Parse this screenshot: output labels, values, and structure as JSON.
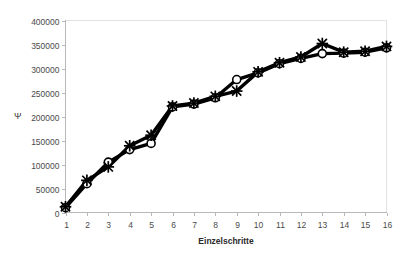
{
  "chart_data": {
    "type": "line",
    "title": "",
    "subtitle": "",
    "xlabel": "Einzelschritte",
    "ylabel": "Ψ",
    "x": [
      1,
      2,
      3,
      4,
      5,
      6,
      7,
      8,
      9,
      10,
      11,
      12,
      13,
      14,
      15,
      16
    ],
    "categories": [
      "1",
      "2",
      "3",
      "4",
      "5",
      "6",
      "7",
      "8",
      "9",
      "10",
      "11",
      "12",
      "13",
      "14",
      "15",
      "16"
    ],
    "xlim": [
      1,
      16
    ],
    "ylim": [
      0,
      400000
    ],
    "ytick_values": [
      0,
      50000,
      100000,
      150000,
      200000,
      250000,
      300000,
      350000,
      400000
    ],
    "ytick_labels": [
      "0",
      "50000",
      "100000",
      "150000",
      "200000",
      "250000",
      "300000",
      "350000",
      "400000"
    ],
    "xtick_labels": [
      "1",
      "2",
      "3",
      "4",
      "5",
      "6",
      "7",
      "8",
      "9",
      "10",
      "11",
      "12",
      "13",
      "14",
      "15",
      "16"
    ],
    "grid": false,
    "legend": false,
    "legend_position": "none",
    "series": [
      {
        "name": "Serie 1",
        "marker": "circle",
        "color": "#000000",
        "values": [
          10000,
          60000,
          105000,
          131000,
          144000,
          220000,
          226000,
          239000,
          277000,
          291000,
          310000,
          321000,
          331000,
          332000,
          334000,
          343000
        ]
      },
      {
        "name": "Serie 2",
        "marker": "x",
        "color": "#000000",
        "values": [
          12000,
          67000,
          95000,
          139000,
          161000,
          222000,
          228000,
          242000,
          253000,
          293000,
          312000,
          324000,
          352000,
          334000,
          336000,
          346000
        ]
      }
    ],
    "annotations": []
  },
  "axes": {
    "y_axis_name": "y-axis",
    "x_axis_name": "x-axis"
  }
}
